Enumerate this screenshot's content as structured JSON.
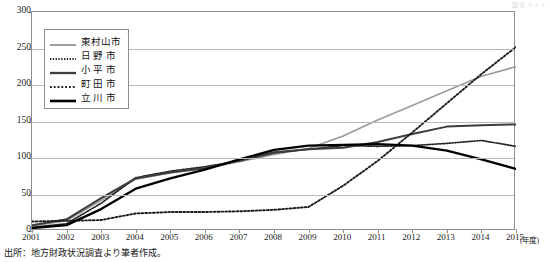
{
  "corner_note": "図表 3-4-1",
  "source": "出所：地方財政状況調査より筆者作成。",
  "axis": {
    "x_unit": "(年度)",
    "y_ticks": [
      "0",
      "50",
      "100",
      "150",
      "200",
      "250",
      "300"
    ],
    "x_ticks": [
      "2001",
      "2002",
      "2003",
      "2004",
      "2005",
      "2006",
      "2007",
      "2008",
      "2009",
      "2010",
      "2011",
      "2012",
      "2013",
      "2014",
      "2015"
    ]
  },
  "legend": {
    "items": [
      {
        "label": "東村山市",
        "style": "solid-gray",
        "color": "#9a9a9a"
      },
      {
        "label": "日 野 市",
        "style": "dotted-fine",
        "color": "#2b2b2b"
      },
      {
        "label": "小 平 市",
        "style": "solid-dark",
        "color": "#3d3d3d"
      },
      {
        "label": "町 田 市",
        "style": "dotted-coarse",
        "color": "#2b2b2b"
      },
      {
        "label": "立 川 市",
        "style": "solid-black",
        "color": "#000000"
      }
    ]
  },
  "chart_data": {
    "type": "line",
    "title": "",
    "xlabel": "(年度)",
    "ylabel": "",
    "xlim": [
      2001,
      2015
    ],
    "ylim": [
      0,
      300
    ],
    "grid": true,
    "legend_position": "upper-left-inside",
    "x": [
      2001,
      2002,
      2003,
      2004,
      2005,
      2006,
      2007,
      2008,
      2009,
      2010,
      2011,
      2012,
      2013,
      2014,
      2015
    ],
    "series": [
      {
        "name": "東村山市",
        "values": [
          7,
          14,
          42,
          71,
          80,
          86,
          95,
          105,
          113,
          130,
          152,
          172,
          192,
          212,
          225
        ]
      },
      {
        "name": "日 野 市",
        "values": [
          5,
          10,
          38,
          73,
          82,
          88,
          96,
          107,
          112,
          117,
          116,
          117,
          120,
          124,
          116
        ]
      },
      {
        "name": "小 平 市",
        "values": [
          8,
          16,
          45,
          72,
          80,
          86,
          97,
          108,
          112,
          114,
          122,
          133,
          143,
          145,
          146
        ]
      },
      {
        "name": "町 田 市",
        "values": [
          13,
          14,
          15,
          24,
          26,
          26,
          27,
          29,
          33,
          62,
          96,
          135,
          175,
          215,
          252
        ]
      },
      {
        "name": "立 川 市",
        "values": [
          4,
          8,
          30,
          58,
          72,
          84,
          98,
          111,
          117,
          118,
          119,
          117,
          110,
          98,
          85
        ]
      }
    ]
  }
}
